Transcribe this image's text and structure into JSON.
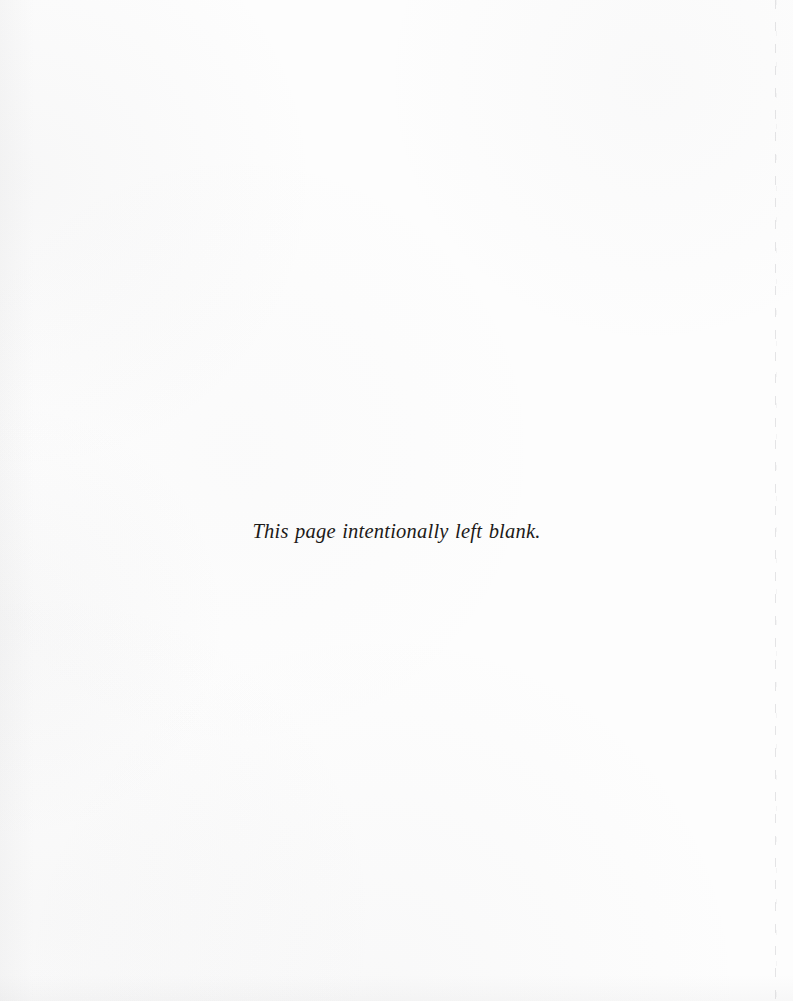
{
  "page": {
    "kind": "scanned-book-page",
    "width": 793,
    "height": 1001,
    "background_color": "#fdfdfd",
    "ink_color": "#1c1a18",
    "notice_text": "This page intentionally left blank.",
    "artifacts": {
      "edge_line_label": "page-edge-scan-line",
      "edge_line_color": "#78787f"
    }
  }
}
